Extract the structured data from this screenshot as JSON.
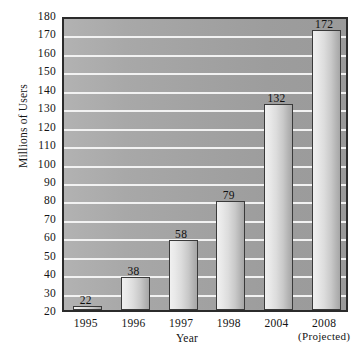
{
  "chart_data": {
    "type": "bar",
    "title": "",
    "xlabel": "Year",
    "ylabel": "Millions of Users",
    "categories": [
      "1995",
      "1996",
      "1997",
      "1998",
      "2004",
      "2008"
    ],
    "category_sublabels": [
      "",
      "",
      "",
      "",
      "",
      "(Projected)"
    ],
    "values": [
      22,
      38,
      58,
      79,
      132,
      172
    ],
    "data_labels": [
      "22",
      "38",
      "58",
      "79",
      "132",
      "172"
    ],
    "ylim": [
      20,
      180
    ],
    "ytick_step": 10,
    "yticks": [
      180,
      170,
      160,
      150,
      140,
      130,
      120,
      110,
      100,
      90,
      80,
      70,
      60,
      50,
      40,
      30,
      20
    ],
    "ytick_labels": [
      "180",
      "170",
      "160",
      "150",
      "140",
      "130",
      "120",
      "110",
      "100",
      "90",
      "80",
      "70",
      "60",
      "50",
      "40",
      "30",
      "20"
    ],
    "grid": true,
    "grid_orientation": "horizontal",
    "legend": false,
    "legend_position": "none",
    "colors": {
      "plot_background": "#a6a6a6",
      "gridline": "#f2f2f2",
      "bar_fill_light": "#f0f0f0",
      "bar_fill_dark": "#a6a6a6",
      "bar_border": "#3a3a3a",
      "axis_border": "#2b2b2b",
      "text": "#141414",
      "page_background": "#ffffff"
    }
  }
}
